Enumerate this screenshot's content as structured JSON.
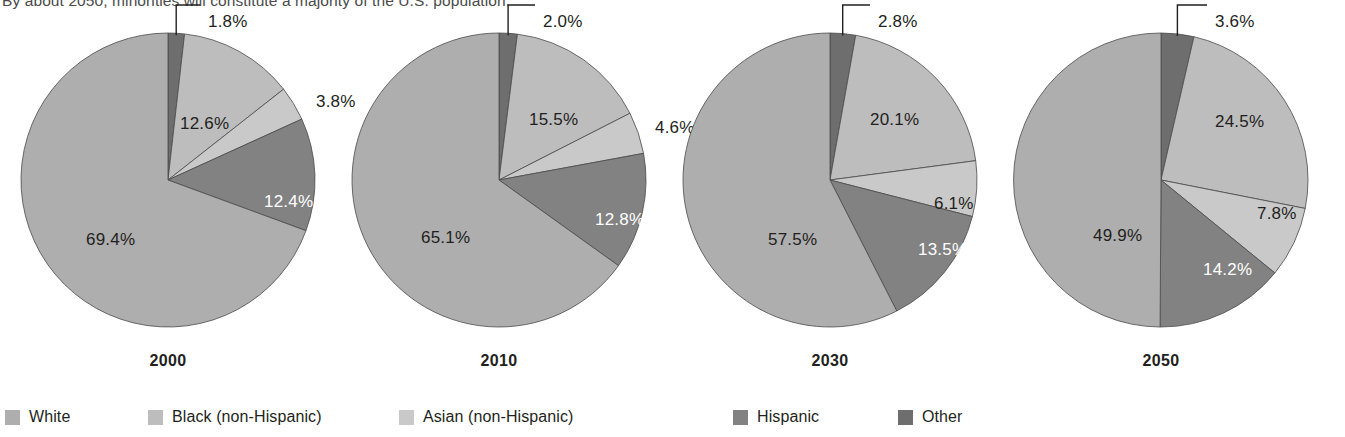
{
  "headline": "By about 2050, minorities will constitute a majority of the U.S. population.",
  "colors": {
    "white": "#aeaeae",
    "black_non_hispanic": "#bdbdbd",
    "asian_non_hispanic": "#c9c9c9",
    "hispanic": "#828282",
    "other": "#6e6e6e",
    "outline": "#4a4a4a",
    "label_dark": "#231f20",
    "label_light": "#ffffff",
    "background": "#ffffff"
  },
  "legend": {
    "position": "bottom",
    "items": [
      {
        "label": "White",
        "color_key": "white",
        "x": 5
      },
      {
        "label": "Black (non-Hispanic)",
        "color_key": "black_non_hispanic",
        "x": 148
      },
      {
        "label": "Asian (non-Hispanic)",
        "color_key": "asian_non_hispanic",
        "x": 399
      },
      {
        "label": "Hispanic",
        "color_key": "hispanic",
        "x": 733
      },
      {
        "label": "Other",
        "color_key": "other",
        "x": 898
      }
    ]
  },
  "chart_data": {
    "type": "pie",
    "title": "By about 2050, minorities will constitute a majority of the U.S. population.",
    "xlabel": "",
    "ylabel": "",
    "value_unit": "percent",
    "categories": [
      "Other",
      "Black (non-Hispanic)",
      "Asian (non-Hispanic)",
      "Hispanic",
      "White"
    ],
    "slice_order_clockwise_from_top": [
      "Other",
      "Black (non-Hispanic)",
      "Asian (non-Hispanic)",
      "Hispanic",
      "White"
    ],
    "panels": [
      {
        "label": "2000",
        "values": [
          1.8,
          12.6,
          3.8,
          12.4,
          69.4
        ],
        "slices": [
          {
            "name": "Other",
            "value": 1.8,
            "display": "1.8%",
            "color_key": "other",
            "label_style": "dark",
            "callout": true
          },
          {
            "name": "Black (non-Hispanic)",
            "value": 12.6,
            "display": "12.6%",
            "color_key": "black_non_hispanic",
            "label_style": "dark",
            "callout": false
          },
          {
            "name": "Asian (non-Hispanic)",
            "value": 3.8,
            "display": "3.8%",
            "color_key": "asian_non_hispanic",
            "label_style": "dark",
            "callout": false
          },
          {
            "name": "Hispanic",
            "value": 12.4,
            "display": "12.4%",
            "color_key": "hispanic",
            "label_style": "light",
            "callout": false
          },
          {
            "name": "White",
            "value": 69.4,
            "display": "69.4%",
            "color_key": "white",
            "label_style": "dark",
            "callout": false
          }
        ]
      },
      {
        "label": "2010",
        "values": [
          2.0,
          15.5,
          4.6,
          12.8,
          65.1
        ],
        "slices": [
          {
            "name": "Other",
            "value": 2.0,
            "display": "2.0%",
            "color_key": "other",
            "label_style": "dark",
            "callout": true
          },
          {
            "name": "Black (non-Hispanic)",
            "value": 15.5,
            "display": "15.5%",
            "color_key": "black_non_hispanic",
            "label_style": "dark",
            "callout": false
          },
          {
            "name": "Asian (non-Hispanic)",
            "value": 4.6,
            "display": "4.6%",
            "color_key": "asian_non_hispanic",
            "label_style": "dark",
            "callout": false
          },
          {
            "name": "Hispanic",
            "value": 12.8,
            "display": "12.8%",
            "color_key": "hispanic",
            "label_style": "light",
            "callout": false
          },
          {
            "name": "White",
            "value": 65.1,
            "display": "65.1%",
            "color_key": "white",
            "label_style": "dark",
            "callout": false
          }
        ]
      },
      {
        "label": "2030",
        "values": [
          2.8,
          20.1,
          6.1,
          13.5,
          57.5
        ],
        "slices": [
          {
            "name": "Other",
            "value": 2.8,
            "display": "2.8%",
            "color_key": "other",
            "label_style": "dark",
            "callout": true
          },
          {
            "name": "Black (non-Hispanic)",
            "value": 20.1,
            "display": "20.1%",
            "color_key": "black_non_hispanic",
            "label_style": "dark",
            "callout": false
          },
          {
            "name": "Asian (non-Hispanic)",
            "value": 6.1,
            "display": "6.1%",
            "color_key": "asian_non_hispanic",
            "label_style": "dark",
            "callout": false
          },
          {
            "name": "Hispanic",
            "value": 13.5,
            "display": "13.5%",
            "color_key": "hispanic",
            "label_style": "light",
            "callout": false
          },
          {
            "name": "White",
            "value": 57.5,
            "display": "57.5%",
            "color_key": "white",
            "label_style": "dark",
            "callout": false
          }
        ]
      },
      {
        "label": "2050",
        "values": [
          3.6,
          24.5,
          7.8,
          14.2,
          49.9
        ],
        "slices": [
          {
            "name": "Other",
            "value": 3.6,
            "display": "3.6%",
            "color_key": "other",
            "label_style": "dark",
            "callout": true
          },
          {
            "name": "Black (non-Hispanic)",
            "value": 24.5,
            "display": "24.5%",
            "color_key": "black_non_hispanic",
            "label_style": "dark",
            "callout": false
          },
          {
            "name": "Asian (non-Hispanic)",
            "value": 7.8,
            "display": "7.8%",
            "color_key": "asian_non_hispanic",
            "label_style": "dark",
            "callout": false
          },
          {
            "name": "Hispanic",
            "value": 14.2,
            "display": "14.2%",
            "color_key": "hispanic",
            "label_style": "light",
            "callout": false
          },
          {
            "name": "White",
            "value": 49.9,
            "display": "49.9%",
            "color_key": "white",
            "label_style": "dark",
            "callout": false
          }
        ]
      }
    ]
  }
}
